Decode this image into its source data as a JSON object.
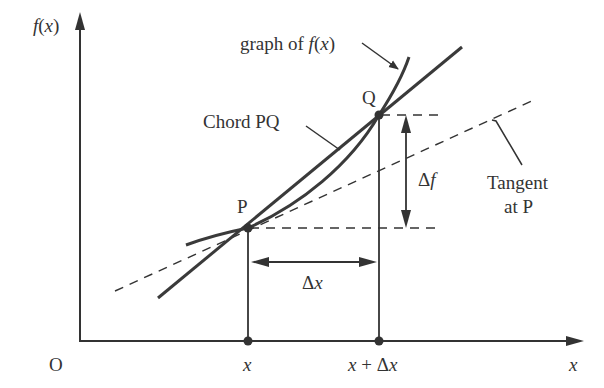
{
  "axes": {
    "y_label": "f(x)",
    "x_label": "x",
    "origin_label": "O"
  },
  "points": {
    "P": "P",
    "Q": "Q"
  },
  "ticks": {
    "x1": "x",
    "x2": "x + Δx"
  },
  "labels": {
    "graph": "graph of f(x)",
    "chord": "Chord PQ",
    "tangent_line1": "Tangent",
    "tangent_line2": "at P",
    "delta_f": "Δf",
    "delta_x": "Δx"
  },
  "colors": {
    "line": "#3a3a3a",
    "text": "#333333"
  }
}
